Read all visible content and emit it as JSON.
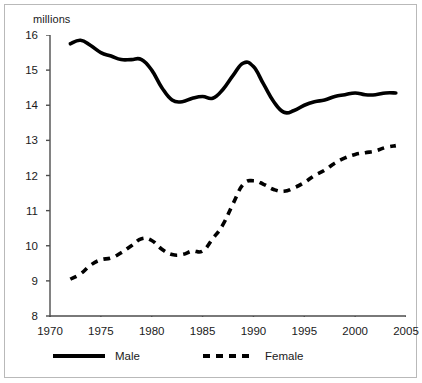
{
  "chart_data": {
    "type": "line",
    "title": "",
    "subtitle": "",
    "xlabel": "",
    "ylabel": "millions",
    "unit_label": "millions",
    "xlim": [
      1970,
      2005
    ],
    "ylim": [
      8,
      16
    ],
    "grid": false,
    "legend_position": "bottom",
    "xticks": [
      "1970",
      "1975",
      "1980",
      "1985",
      "1990",
      "1995",
      "2000",
      "2005"
    ],
    "xtick_values": [
      1970,
      1975,
      1980,
      1985,
      1990,
      1995,
      2000,
      2005
    ],
    "yticks": [
      "8",
      "9",
      "10",
      "11",
      "12",
      "13",
      "14",
      "15",
      "16"
    ],
    "ytick_values": [
      8,
      9,
      10,
      11,
      12,
      13,
      14,
      15,
      16
    ],
    "x": [
      1972,
      1973,
      1974,
      1975,
      1976,
      1977,
      1978,
      1979,
      1980,
      1981,
      1982,
      1983,
      1984,
      1985,
      1986,
      1987,
      1988,
      1989,
      1990,
      1991,
      1992,
      1993,
      1994,
      1995,
      1996,
      1997,
      1998,
      1999,
      2000,
      2001,
      2002,
      2003,
      2004
    ],
    "series": [
      {
        "name": "Male",
        "style": "solid",
        "color": "#000000",
        "values": [
          15.75,
          15.85,
          15.7,
          15.5,
          15.4,
          15.3,
          15.3,
          15.3,
          15.0,
          14.5,
          14.15,
          14.1,
          14.2,
          14.25,
          14.2,
          14.45,
          14.85,
          15.2,
          15.1,
          14.6,
          14.1,
          13.8,
          13.85,
          14.0,
          14.1,
          14.15,
          14.25,
          14.3,
          14.35,
          14.3,
          14.3,
          14.35,
          14.35
        ]
      },
      {
        "name": "Female",
        "style": "dashed",
        "color": "#000000",
        "values": [
          9.05,
          9.2,
          9.45,
          9.6,
          9.65,
          9.8,
          10.0,
          10.2,
          10.15,
          9.9,
          9.75,
          9.75,
          9.85,
          9.85,
          10.2,
          10.6,
          11.2,
          11.75,
          11.85,
          11.75,
          11.6,
          11.55,
          11.65,
          11.8,
          12.0,
          12.15,
          12.35,
          12.5,
          12.6,
          12.65,
          12.7,
          12.8,
          12.85
        ]
      }
    ]
  },
  "legend": [
    {
      "label": "Male"
    },
    {
      "label": "Female"
    }
  ]
}
